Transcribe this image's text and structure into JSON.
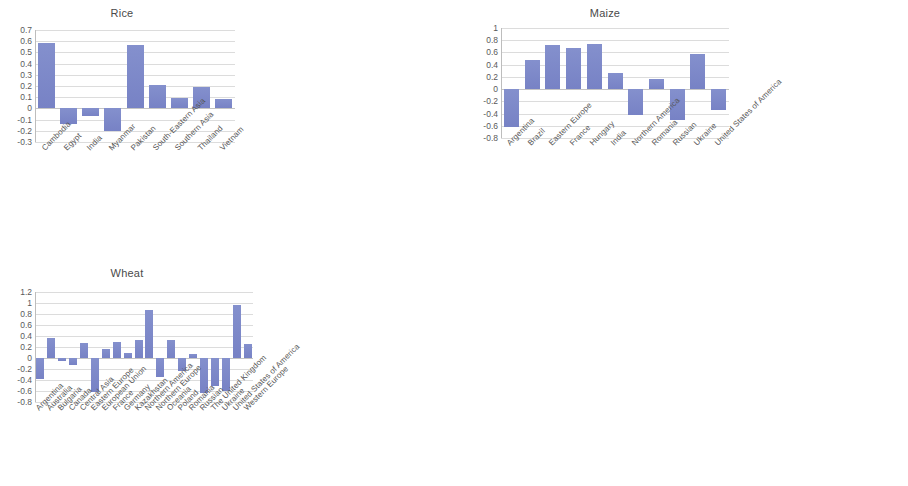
{
  "page": {
    "background": "#ffffff",
    "bar_color": "#7c88c8",
    "gridline_color": "#dcdcdc",
    "text_color": "#4d4d4d"
  },
  "charts": [
    {
      "id": "rice",
      "title": "Rice"
    },
    {
      "id": "maize",
      "title": "Maize"
    },
    {
      "id": "wheat",
      "title": "Wheat"
    }
  ],
  "chart_data": [
    {
      "type": "bar",
      "id": "rice",
      "title": "Rice",
      "xlabel": "",
      "ylabel": "",
      "ylim": [
        -0.3,
        0.7
      ],
      "yticks": [
        0.7,
        0.6,
        0.5,
        0.4,
        0.3,
        0.2,
        0.1,
        0,
        -0.1,
        -0.2,
        -0.3
      ],
      "ytick_labels": [
        "0.7",
        "0.6",
        "0.5",
        "0.4",
        "0.3",
        "0.2",
        "0.1",
        "0",
        "-0.1",
        "-0.2",
        "-0.3"
      ],
      "grid": true,
      "legend": false,
      "categories": [
        "Cambodia",
        "Egypt",
        "India",
        "Myanmar",
        "Pakistan",
        "South-Eastern Asia",
        "Southern Asia",
        "Thailand",
        "Vietnam"
      ],
      "values": [
        0.58,
        -0.14,
        -0.07,
        -0.2,
        0.57,
        0.21,
        0.09,
        0.19,
        0.08
      ]
    },
    {
      "type": "bar",
      "id": "maize",
      "title": "Maize",
      "xlabel": "",
      "ylabel": "",
      "ylim": [
        -0.8,
        1.0
      ],
      "yticks": [
        1,
        0.8,
        0.6,
        0.4,
        0.2,
        0,
        -0.2,
        -0.4,
        -0.6,
        -0.8
      ],
      "ytick_labels": [
        "1",
        "0.8",
        "0.6",
        "0.4",
        "0.2",
        "0",
        "-0.2",
        "-0.4",
        "-0.6",
        "-0.8"
      ],
      "grid": true,
      "legend": false,
      "categories": [
        "Argentina",
        "Brazil",
        "Eastern Europe",
        "France",
        "Hungary",
        "India",
        "Northern America",
        "Romania",
        "Russian",
        "Ukraine",
        "United States of America"
      ],
      "values": [
        -0.62,
        0.48,
        0.73,
        0.68,
        0.74,
        0.27,
        -0.42,
        0.16,
        -0.5,
        0.58,
        -0.35
      ]
    },
    {
      "type": "bar",
      "id": "wheat",
      "title": "Wheat",
      "xlabel": "",
      "ylabel": "",
      "ylim": [
        -0.8,
        1.2
      ],
      "yticks": [
        1.2,
        1,
        0.8,
        0.6,
        0.4,
        0.2,
        0,
        -0.2,
        -0.4,
        -0.6,
        -0.8
      ],
      "ytick_labels": [
        "1.2",
        "1",
        "0.8",
        "0.6",
        "0.4",
        "0.2",
        "0",
        "-0.2",
        "-0.4",
        "-0.6",
        "-0.8"
      ],
      "grid": true,
      "legend": false,
      "categories": [
        "Argentina",
        "Australia",
        "Bulgaria",
        "Canada",
        "Central Asia",
        "Eastern Europe",
        "European Union",
        "France",
        "Germany",
        "Kazakhstan",
        "Northern America",
        "Northern Europe",
        "Oceania",
        "Poland",
        "Romania",
        "Russian",
        "The United Kingdom",
        "Ukraine",
        "United States of America",
        "Western Europe"
      ],
      "values": [
        -0.38,
        0.36,
        -0.06,
        -0.12,
        0.27,
        -0.62,
        0.17,
        0.29,
        0.09,
        0.33,
        0.87,
        -0.35,
        0.33,
        -0.23,
        0.08,
        -0.63,
        -0.5,
        -0.6,
        0.97,
        0.25
      ]
    }
  ]
}
